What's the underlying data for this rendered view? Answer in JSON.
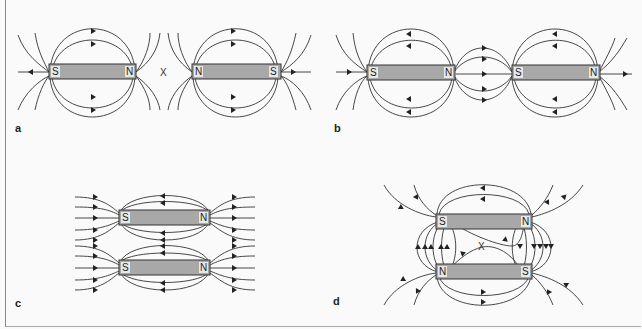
{
  "figure": {
    "panels": [
      {
        "id": "a",
        "label": "a",
        "description": "Two bar magnets with like poles (N facing N) — neutral point between them",
        "magnets": [
          {
            "left_pole": "S",
            "right_pole": "N"
          },
          {
            "left_pole": "N",
            "right_pole": "S"
          }
        ],
        "neutral_point": "X"
      },
      {
        "id": "b",
        "label": "b",
        "description": "Two bar magnets with unlike poles facing (N facing S) — field lines connect",
        "magnets": [
          {
            "left_pole": "S",
            "right_pole": "N"
          },
          {
            "left_pole": "S",
            "right_pole": "N"
          }
        ]
      },
      {
        "id": "c",
        "label": "c",
        "description": "Two parallel bar magnets, same orientation",
        "magnets": [
          {
            "left_pole": "S",
            "right_pole": "N"
          },
          {
            "left_pole": "S",
            "right_pole": "N"
          }
        ]
      },
      {
        "id": "d",
        "label": "d",
        "description": "Two parallel bar magnets, opposite orientation — neutral point between them",
        "magnets": [
          {
            "left_pole": "S",
            "right_pole": "N"
          },
          {
            "left_pole": "N",
            "right_pole": "S"
          }
        ],
        "neutral_point": "X"
      }
    ],
    "colors": {
      "magnet_fill": "#a8a8a8",
      "line": "#333333",
      "pole_box": "#e8e8e8"
    }
  }
}
